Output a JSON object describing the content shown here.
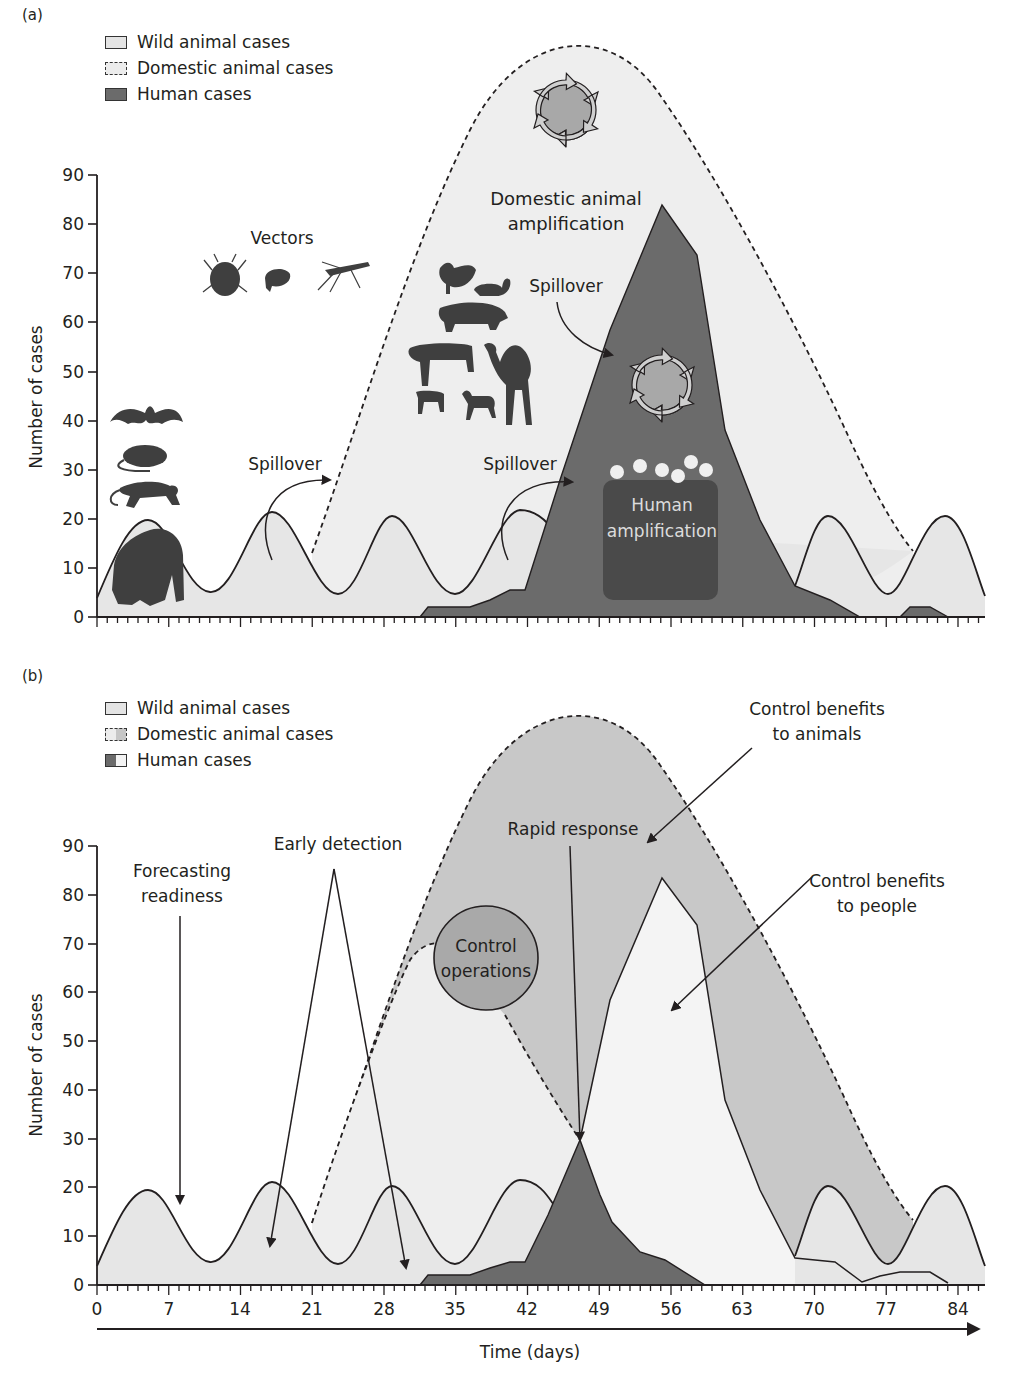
{
  "panel_a": {
    "label": "(a)",
    "legend": [
      {
        "label": "Wild animal cases",
        "style": "solid-light"
      },
      {
        "label": "Domestic animal cases",
        "style": "dashed-light"
      },
      {
        "label": "Human cases",
        "style": "solid-dark"
      }
    ],
    "y_axis_label": "Number of cases",
    "y_ticks": [
      "0",
      "10",
      "20",
      "30",
      "40",
      "50",
      "60",
      "70",
      "80",
      "90"
    ],
    "annotations": {
      "vectors": "Vectors",
      "domestic_amp_line1": "Domestic animal",
      "domestic_amp_line2": "amplification",
      "spillover_1": "Spillover",
      "spillover_2": "Spillover",
      "spillover_3": "Spillover",
      "human_amp_line1": "Human",
      "human_amp_line2": "amplification"
    },
    "icons": [
      "bat-icon",
      "rat-icon",
      "monkey-icon",
      "gorilla-icon",
      "tick-icon",
      "flea-icon",
      "mosquito-icon",
      "chicken-icon",
      "duck-icon",
      "pig-icon",
      "cow-icon",
      "camel-icon",
      "calf-icon",
      "goat-icon",
      "amplification-cycle-icon",
      "people-group-icon"
    ]
  },
  "panel_b": {
    "label": "(b)",
    "legend": [
      {
        "label": "Wild animal cases",
        "style": "solid-light"
      },
      {
        "label": "Domestic animal cases",
        "style": "dashed-split"
      },
      {
        "label": "Human cases",
        "style": "solid-split"
      }
    ],
    "y_axis_label": "Number of cases",
    "y_ticks": [
      "0",
      "10",
      "20",
      "30",
      "40",
      "50",
      "60",
      "70",
      "80",
      "90"
    ],
    "x_ticks": [
      "0",
      "7",
      "14",
      "21",
      "28",
      "35",
      "42",
      "49",
      "56",
      "63",
      "70",
      "77",
      "84"
    ],
    "x_axis_label": "Time (days)",
    "annotations": {
      "forecasting_line1": "Forecasting",
      "forecasting_line2": "readiness",
      "early_detection": "Early detection",
      "control_ops_line1": "Control",
      "control_ops_line2": "operations",
      "rapid_response": "Rapid response",
      "benefit_animals_line1": "Control benefits",
      "benefit_animals_line2": "to animals",
      "benefit_people_line1": "Control benefits",
      "benefit_people_line2": "to people"
    }
  },
  "colors": {
    "wild_fill": "#e6e6e6",
    "domestic_fill": "#eeeeee",
    "domestic_reduced_fill": "#c8c8c8",
    "human_fill": "#6b6b6b",
    "human_prevented_fill": "#f4f4f4",
    "control_circle": "#a9a9a9",
    "line": "#231f20"
  },
  "chart_data": [
    {
      "type": "area",
      "title": "(a) Uncontrolled zoonotic outbreak",
      "xlabel": "Time (days)",
      "ylabel": "Number of cases",
      "xlim": [
        0,
        86
      ],
      "ylim": [
        0,
        90
      ],
      "y_ticks": [
        0,
        10,
        20,
        30,
        40,
        50,
        60,
        70,
        80,
        90
      ],
      "grid": false,
      "legend_position": "top-left",
      "series": [
        {
          "name": "Wild animal cases",
          "style": "solid line, light fill",
          "x": [
            0,
            5,
            10,
            17,
            23,
            29,
            35,
            41,
            47,
            53,
            59,
            65,
            71,
            76,
            82,
            86
          ],
          "y": [
            4,
            19,
            5,
            20,
            5,
            20,
            5,
            21,
            5,
            20,
            5,
            20,
            5,
            20,
            4,
            20
          ]
        },
        {
          "name": "Domestic animal cases",
          "style": "dashed line, light fill",
          "x": [
            21,
            28,
            35,
            42,
            46,
            49,
            56,
            63,
            70,
            75,
            79
          ],
          "y": [
            10,
            55,
            80,
            91,
            93,
            91,
            82,
            60,
            35,
            18,
            7
          ]
        },
        {
          "name": "Human cases",
          "style": "solid, dark fill",
          "x": [
            32,
            34,
            38,
            40,
            42,
            45,
            49,
            55,
            57,
            60,
            66,
            68,
            72,
            75,
            77,
            79,
            81,
            83
          ],
          "y": [
            0,
            2,
            2,
            3,
            5,
            18,
            55,
            84,
            74,
            30,
            8,
            4,
            2,
            0,
            0,
            2,
            2,
            0
          ]
        }
      ],
      "annotations": [
        "Vectors",
        "Domestic animal amplification",
        "Spillover",
        "Spillover",
        "Spillover",
        "Human amplification"
      ]
    },
    {
      "type": "area",
      "title": "(b) Outbreak with early detection and control",
      "xlabel": "Time (days)",
      "ylabel": "Number of cases",
      "xlim": [
        0,
        86
      ],
      "ylim": [
        0,
        90
      ],
      "x_ticks": [
        0,
        7,
        14,
        21,
        28,
        35,
        42,
        49,
        56,
        63,
        70,
        77,
        84
      ],
      "y_ticks": [
        0,
        10,
        20,
        30,
        40,
        50,
        60,
        70,
        80,
        90
      ],
      "grid": false,
      "legend_position": "top-left",
      "series": [
        {
          "name": "Wild animal cases",
          "x": [
            0,
            5,
            10,
            17,
            23,
            29,
            35,
            41,
            47,
            53,
            59,
            65,
            71,
            76,
            82,
            86
          ],
          "y": [
            4,
            19,
            5,
            20,
            5,
            20,
            5,
            21,
            5,
            20,
            5,
            20,
            5,
            20,
            4,
            20
          ]
        },
        {
          "name": "Domestic animal cases (uncontrolled)",
          "x": [
            21,
            28,
            35,
            42,
            46,
            49,
            56,
            63,
            70,
            75,
            79
          ],
          "y": [
            10,
            55,
            80,
            91,
            93,
            91,
            82,
            60,
            35,
            18,
            7
          ]
        },
        {
          "name": "Domestic animal cases (controlled)",
          "x": [
            21,
            28,
            31,
            34,
            37,
            40,
            43,
            47
          ],
          "y": [
            10,
            55,
            70,
            72,
            68,
            55,
            42,
            30
          ]
        },
        {
          "name": "Human cases (uncontrolled, prevented)",
          "x": [
            42,
            46,
            49,
            55,
            57,
            60,
            66,
            68,
            72,
            75,
            77,
            79,
            81,
            83
          ],
          "y": [
            5,
            30,
            55,
            84,
            74,
            30,
            8,
            4,
            2,
            0,
            0,
            2,
            2,
            0
          ]
        },
        {
          "name": "Human cases (controlled)",
          "x": [
            32,
            34,
            38,
            40,
            42,
            44,
            46,
            48,
            50,
            53,
            56,
            59
          ],
          "y": [
            0,
            2,
            2,
            3,
            5,
            14,
            30,
            22,
            13,
            6,
            4,
            0
          ]
        }
      ],
      "annotations": [
        "Forecasting readiness",
        "Early detection",
        "Control operations",
        "Rapid response",
        "Control benefits to animals",
        "Control benefits to people"
      ]
    }
  ]
}
